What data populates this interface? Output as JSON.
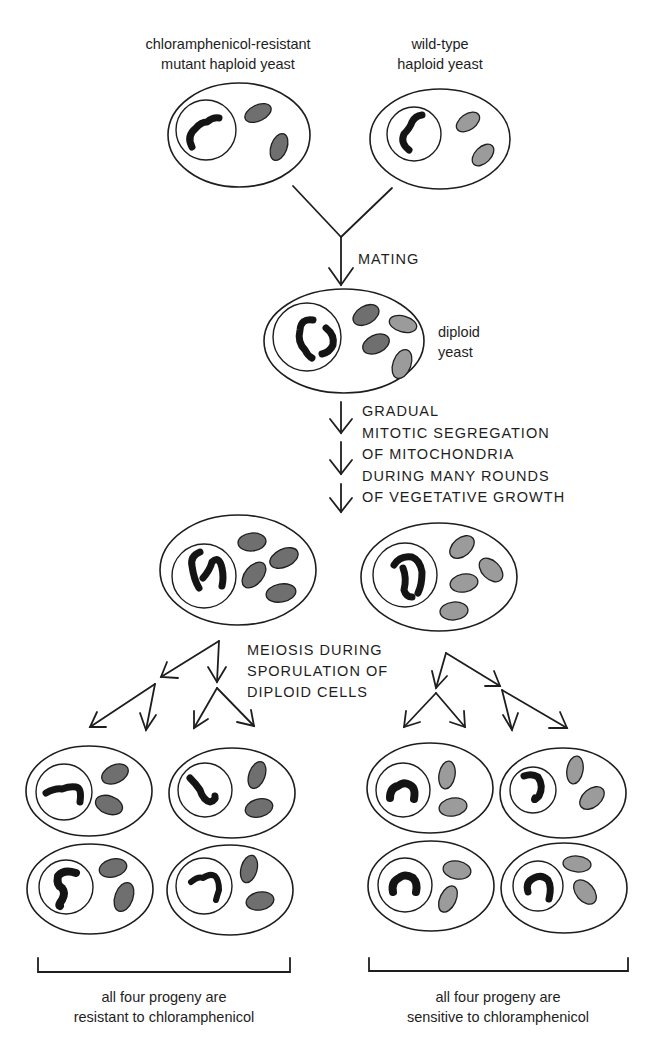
{
  "figure": {
    "parents": {
      "mutant": {
        "label_line1": "chloramphenicol-resistant",
        "label_line2": "mutant haploid yeast",
        "mitochondria_shade": "dark"
      },
      "wild_type": {
        "label_line1": "wild-type",
        "label_line2": "haploid yeast",
        "mitochondria_shade": "light"
      }
    },
    "step_mating": {
      "label": "MATING"
    },
    "diploid": {
      "label_line1": "diploid",
      "label_line2": "yeast"
    },
    "step_segregation": {
      "lines": [
        "GRADUAL",
        "MITOTIC SEGREGATION",
        "OF MITOCHONDRIA",
        "DURING MANY ROUNDS",
        "OF VEGETATIVE GROWTH"
      ]
    },
    "step_meiosis": {
      "lines": [
        "MEIOSIS DURING",
        "SPORULATION OF",
        "DIPLOID CELLS"
      ]
    },
    "progeny": {
      "resistant": {
        "caption_line1": "all four progeny are",
        "caption_line2": "resistant to chloramphenicol",
        "count": 4
      },
      "sensitive": {
        "caption_line1": "all four progeny are",
        "caption_line2": "sensitive to chloramphenicol",
        "count": 4
      }
    },
    "colors": {
      "mutant_mitochondria": "#6f6f6f",
      "wildtype_mitochondria": "#9b9b9b",
      "outline": "#1e1e1e"
    }
  }
}
